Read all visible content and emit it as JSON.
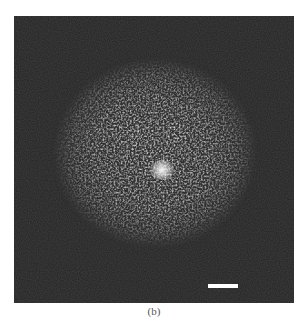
{
  "figure": {
    "panel_label": "(b)",
    "background_color": "#2a2a2a",
    "blob": {
      "center_x": 141,
      "center_y": 137,
      "radius_x": 102,
      "radius_y": 95,
      "core_color": "#e8e8e8",
      "edge_color": "#2a2a2a"
    },
    "bright_spot": {
      "x": 148,
      "y": 154
    },
    "scale_bar_color": "#ffffff"
  }
}
